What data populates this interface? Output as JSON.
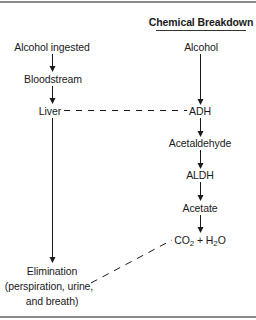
{
  "diagram": {
    "type": "flowchart",
    "title": "Chemical Breakdown",
    "left_column": {
      "nodes": [
        {
          "id": "alcohol_ingested",
          "label": "Alcohol ingested"
        },
        {
          "id": "bloodstream",
          "label": "Bloodstream"
        },
        {
          "id": "liver",
          "label": "Liver"
        },
        {
          "id": "elimination",
          "label": "Elimination",
          "detail_line1": "(perspiration, urine,",
          "detail_line2": "and breath)"
        }
      ]
    },
    "right_column": {
      "nodes": [
        {
          "id": "alcohol",
          "label": "Alcohol"
        },
        {
          "id": "adh",
          "label": "ADH"
        },
        {
          "id": "acetaldehyde",
          "label": "Acetaldehyde"
        },
        {
          "id": "aldh",
          "label": "ALDH"
        },
        {
          "id": "acetate",
          "label": "Acetate"
        },
        {
          "id": "co2_h2o",
          "label_part1": "CO",
          "sub1": "2",
          "label_part2": " + H",
          "sub2": "2",
          "label_part3": "O"
        }
      ]
    },
    "edges": [
      {
        "from": "alcohol_ingested",
        "to": "bloodstream",
        "style": "solid-arrow"
      },
      {
        "from": "bloodstream",
        "to": "liver",
        "style": "solid-arrow"
      },
      {
        "from": "liver",
        "to": "elimination",
        "style": "solid-arrow"
      },
      {
        "from": "alcohol",
        "to": "adh",
        "style": "solid-arrow"
      },
      {
        "from": "adh",
        "to": "acetaldehyde",
        "style": "solid-arrow"
      },
      {
        "from": "acetaldehyde",
        "to": "aldh",
        "style": "solid-arrow"
      },
      {
        "from": "aldh",
        "to": "acetate",
        "style": "solid-arrow"
      },
      {
        "from": "acetate",
        "to": "co2_h2o",
        "style": "solid-arrow"
      },
      {
        "from": "liver",
        "to": "adh",
        "style": "dashed"
      },
      {
        "from": "co2_h2o",
        "to": "elimination",
        "style": "dashed"
      }
    ],
    "colors": {
      "line": "#1a1a1a",
      "frame": "#8a8a8a",
      "background": "#ffffff"
    }
  }
}
